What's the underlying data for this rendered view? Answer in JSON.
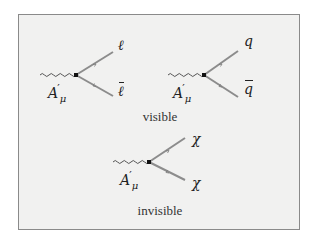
{
  "diagrams": [
    {
      "id": "lepton",
      "boson_label": "A",
      "boson_sub": "μ",
      "boson_prime": "′",
      "out_top": "ℓ",
      "out_bottom": "ℓ"
    },
    {
      "id": "quark",
      "boson_label": "A",
      "boson_sub": "μ",
      "boson_prime": "′",
      "out_top": "q",
      "out_bottom": "q"
    },
    {
      "id": "dark",
      "boson_label": "A",
      "boson_sub": "μ",
      "boson_prime": "′",
      "out_top": "χ",
      "out_bottom": "χ"
    }
  ],
  "captions": {
    "visible": "visible",
    "invisible": "invisible"
  },
  "colors": {
    "background": "#f1f1f0",
    "border": "#8a8a8a",
    "fermion_line": "#8c8c8c",
    "photon_line": "#555555",
    "vertex": "#111111"
  }
}
